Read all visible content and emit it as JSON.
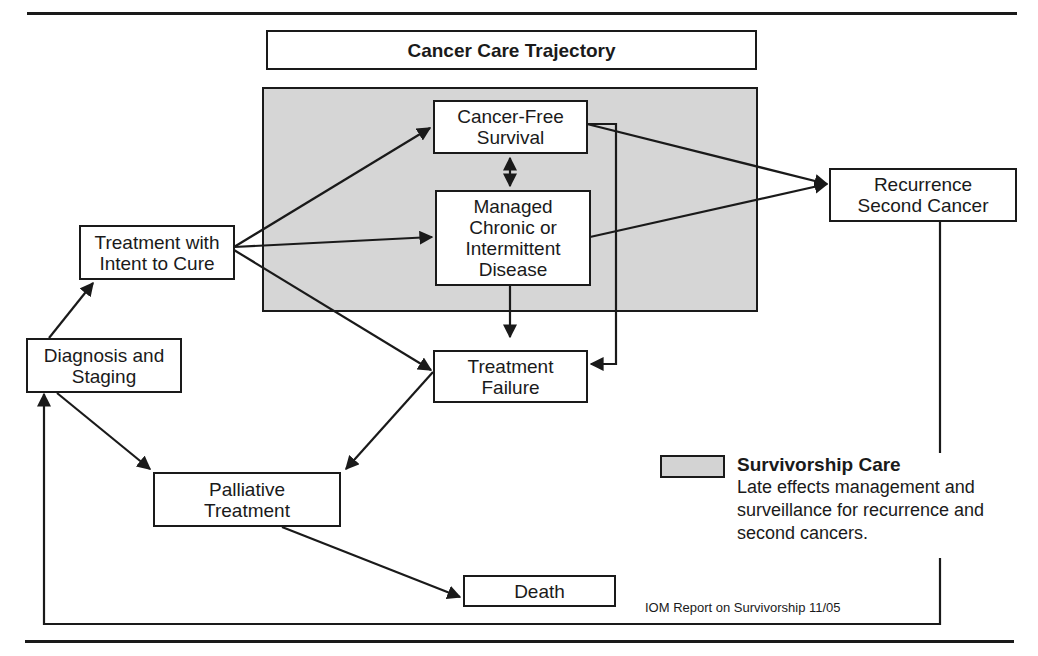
{
  "diagram": {
    "title": "Cancer Care Trajectory",
    "nodes": {
      "cancer_free": "Cancer-Free\nSurvival",
      "managed": "Managed\nChronic or\nIntermittent\nDisease",
      "treatment_cure": "Treatment with\nIntent to Cure",
      "recurrence": "Recurrence\nSecond Cancer",
      "diagnosis": "Diagnosis and\nStaging",
      "treatment_failure": "Treatment\nFailure",
      "palliative": "Palliative\nTreatment",
      "death": "Death"
    },
    "legend": {
      "title": "Survivorship Care",
      "description": "Late effects management and surveillance for recurrence and second cancers.",
      "swatch_color": "#d3d3d3"
    },
    "source": "IOM Report on Survivorship 11/05",
    "edges": [
      {
        "from": "Diagnosis and Staging",
        "to": "Treatment with Intent to Cure"
      },
      {
        "from": "Diagnosis and Staging",
        "to": "Palliative Treatment"
      },
      {
        "from": "Treatment with Intent to Cure",
        "to": "Cancer-Free Survival"
      },
      {
        "from": "Treatment with Intent to Cure",
        "to": "Managed Chronic or Intermittent Disease"
      },
      {
        "from": "Treatment with Intent to Cure",
        "to": "Treatment Failure"
      },
      {
        "from": "Cancer-Free Survival",
        "to": "Managed Chronic or Intermittent Disease",
        "bidirectional": true
      },
      {
        "from": "Cancer-Free Survival",
        "to": "Recurrence Second Cancer"
      },
      {
        "from": "Managed Chronic or Intermittent Disease",
        "to": "Recurrence Second Cancer"
      },
      {
        "from": "Cancer-Free Survival",
        "to": "Treatment Failure"
      },
      {
        "from": "Managed Chronic or Intermittent Disease",
        "to": "Treatment Failure"
      },
      {
        "from": "Treatment Failure",
        "to": "Palliative Treatment"
      },
      {
        "from": "Palliative Treatment",
        "to": "Death"
      },
      {
        "from": "Recurrence Second Cancer",
        "to": "Diagnosis and Staging"
      }
    ]
  }
}
